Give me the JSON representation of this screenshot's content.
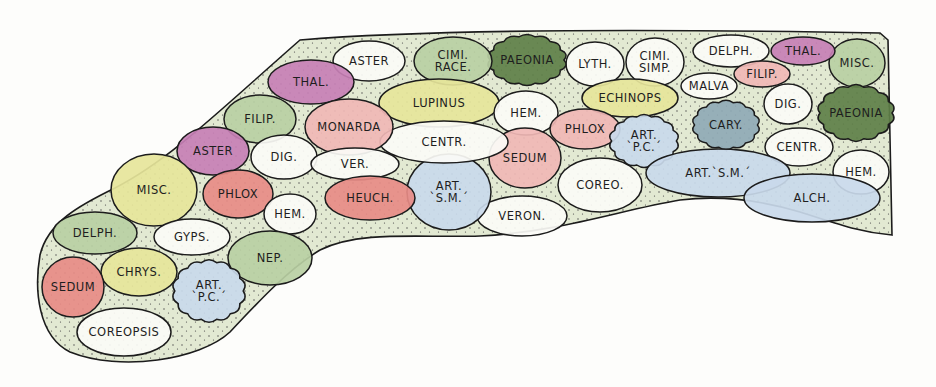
{
  "diagram": {
    "type": "garden-planting-plan",
    "colors": {
      "outline": "#1c1c1c",
      "bed_fill": "#d9e3c8",
      "green": "#b9cfa3",
      "dark_green": "#5e7f48",
      "yellow": "#e6e59a",
      "pink": "#f0b7b5",
      "red": "#e78b86",
      "purple": "#c77fb5",
      "blue": "#c9d9ea",
      "blue_grey": "#8fa9b5",
      "white": "#fbfbf6"
    },
    "plants": [
      {
        "id": "misc-top-right",
        "label": "MISC.",
        "x": 857,
        "y": 63,
        "rx": 28,
        "ry": 24,
        "fill": "green",
        "shape": "ellipse"
      },
      {
        "id": "thal-1",
        "label": "THAL.",
        "x": 803,
        "y": 51,
        "rx": 32,
        "ry": 14,
        "fill": "purple",
        "shape": "ellipse"
      },
      {
        "id": "delph-1",
        "label": "DELPH.",
        "x": 731,
        "y": 51,
        "rx": 38,
        "ry": 16,
        "fill": "white",
        "shape": "ellipse"
      },
      {
        "id": "filip-1",
        "label": "FILIP.",
        "x": 762,
        "y": 74,
        "rx": 28,
        "ry": 13,
        "fill": "pink",
        "shape": "ellipse"
      },
      {
        "id": "malva",
        "label": "MALVA",
        "x": 709,
        "y": 86,
        "rx": 28,
        "ry": 13,
        "fill": "white",
        "shape": "ellipse"
      },
      {
        "id": "cimi-simp",
        "label": "CIMI.\nSIMP.",
        "x": 655,
        "y": 62,
        "rx": 29,
        "ry": 24,
        "fill": "white",
        "shape": "ellipse"
      },
      {
        "id": "lyth",
        "label": "LYTH.",
        "x": 595,
        "y": 64,
        "rx": 29,
        "ry": 22,
        "fill": "white",
        "shape": "ellipse"
      },
      {
        "id": "paeonia-1",
        "label": "PAEONIA",
        "x": 527,
        "y": 60,
        "rx": 41,
        "ry": 27,
        "fill": "dark_green",
        "shape": "cloud"
      },
      {
        "id": "cimi-race",
        "label": "CIMI.\nRACE.",
        "x": 453,
        "y": 61,
        "rx": 39,
        "ry": 24,
        "fill": "green",
        "shape": "ellipse"
      },
      {
        "id": "aster-1",
        "label": "ASTER",
        "x": 369,
        "y": 61,
        "rx": 36,
        "ry": 20,
        "fill": "white",
        "shape": "ellipse"
      },
      {
        "id": "thal-2",
        "label": "THAL.",
        "x": 311,
        "y": 82,
        "rx": 43,
        "ry": 22,
        "fill": "purple",
        "shape": "ellipse"
      },
      {
        "id": "lupinus",
        "label": "LUPINUS",
        "x": 439,
        "y": 103,
        "rx": 60,
        "ry": 24,
        "fill": "yellow",
        "shape": "ellipse"
      },
      {
        "id": "hem-1",
        "label": "HEM.",
        "x": 526,
        "y": 113,
        "rx": 32,
        "ry": 22,
        "fill": "white",
        "shape": "ellipse"
      },
      {
        "id": "echinops",
        "label": "ECHINOPS",
        "x": 630,
        "y": 98,
        "rx": 48,
        "ry": 19,
        "fill": "yellow",
        "shape": "ellipse"
      },
      {
        "id": "phlox-1",
        "label": "PHLOX",
        "x": 585,
        "y": 129,
        "rx": 35,
        "ry": 20,
        "fill": "pink",
        "shape": "ellipse"
      },
      {
        "id": "art-pc-1",
        "label": "ART.\n`P.C.´",
        "x": 644,
        "y": 141,
        "rx": 36,
        "ry": 28,
        "fill": "blue",
        "shape": "cloud"
      },
      {
        "id": "cary",
        "label": "CARY.",
        "x": 726,
        "y": 125,
        "rx": 35,
        "ry": 26,
        "fill": "blue_grey",
        "shape": "cloud"
      },
      {
        "id": "dig-1",
        "label": "DIG.",
        "x": 788,
        "y": 104,
        "rx": 24,
        "ry": 20,
        "fill": "white",
        "shape": "ellipse"
      },
      {
        "id": "paeonia-2",
        "label": "PAEONIA",
        "x": 856,
        "y": 113,
        "rx": 40,
        "ry": 30,
        "fill": "dark_green",
        "shape": "cloud"
      },
      {
        "id": "centr-1",
        "label": "CENTR.",
        "x": 799,
        "y": 147,
        "rx": 34,
        "ry": 19,
        "fill": "white",
        "shape": "ellipse"
      },
      {
        "id": "hem-2",
        "label": "HEM.",
        "x": 861,
        "y": 172,
        "rx": 28,
        "ry": 22,
        "fill": "white",
        "shape": "ellipse"
      },
      {
        "id": "art-sm-1",
        "label": "ART.`S.M.´",
        "x": 718,
        "y": 173,
        "rx": 72,
        "ry": 24,
        "fill": "blue",
        "shape": "ellipse"
      },
      {
        "id": "alch",
        "label": "ALCH.",
        "x": 812,
        "y": 198,
        "rx": 68,
        "ry": 24,
        "fill": "blue",
        "shape": "ellipse"
      },
      {
        "id": "coreo",
        "label": "COREO.",
        "x": 600,
        "y": 185,
        "rx": 42,
        "ry": 27,
        "fill": "white",
        "shape": "ellipse"
      },
      {
        "id": "sedum-1",
        "label": "SEDUM",
        "x": 525,
        "y": 158,
        "rx": 36,
        "ry": 30,
        "fill": "pink",
        "shape": "ellipse"
      },
      {
        "id": "veron",
        "label": "VERON.",
        "x": 522,
        "y": 216,
        "rx": 45,
        "ry": 20,
        "fill": "white",
        "shape": "ellipse"
      },
      {
        "id": "art-sm-2",
        "label": "ART.\n`S.M.´",
        "x": 449,
        "y": 192,
        "rx": 42,
        "ry": 38,
        "fill": "blue",
        "shape": "ellipse"
      },
      {
        "id": "centr-2",
        "label": "CENTR.",
        "x": 444,
        "y": 142,
        "rx": 64,
        "ry": 21,
        "fill": "white",
        "shape": "ellipse"
      },
      {
        "id": "monarda",
        "label": "MONARDA",
        "x": 349,
        "y": 127,
        "rx": 44,
        "ry": 28,
        "fill": "pink",
        "shape": "ellipse"
      },
      {
        "id": "filip-2",
        "label": "FILIP.",
        "x": 260,
        "y": 119,
        "rx": 36,
        "ry": 24,
        "fill": "green",
        "shape": "ellipse"
      },
      {
        "id": "aster-2",
        "label": "ASTER",
        "x": 213,
        "y": 151,
        "rx": 36,
        "ry": 24,
        "fill": "purple",
        "shape": "ellipse"
      },
      {
        "id": "dig-2",
        "label": "DIG.",
        "x": 284,
        "y": 157,
        "rx": 33,
        "ry": 22,
        "fill": "white",
        "shape": "ellipse"
      },
      {
        "id": "ver",
        "label": "VER.",
        "x": 355,
        "y": 164,
        "rx": 44,
        "ry": 16,
        "fill": "white",
        "shape": "ellipse"
      },
      {
        "id": "heuch",
        "label": "HEUCH.",
        "x": 370,
        "y": 198,
        "rx": 45,
        "ry": 22,
        "fill": "red",
        "shape": "ellipse"
      },
      {
        "id": "misc-left",
        "label": "MISC.",
        "x": 154,
        "y": 190,
        "rx": 43,
        "ry": 36,
        "fill": "yellow",
        "shape": "ellipse"
      },
      {
        "id": "phlox-2",
        "label": "PHLOX",
        "x": 238,
        "y": 194,
        "rx": 35,
        "ry": 24,
        "fill": "red",
        "shape": "ellipse"
      },
      {
        "id": "hem-3",
        "label": "HEM.",
        "x": 290,
        "y": 214,
        "rx": 26,
        "ry": 20,
        "fill": "white",
        "shape": "ellipse"
      },
      {
        "id": "delph-2",
        "label": "DELPH.",
        "x": 95,
        "y": 233,
        "rx": 42,
        "ry": 21,
        "fill": "green",
        "shape": "ellipse"
      },
      {
        "id": "gyps",
        "label": "GYPS.",
        "x": 192,
        "y": 237,
        "rx": 38,
        "ry": 18,
        "fill": "white",
        "shape": "ellipse"
      },
      {
        "id": "nep",
        "label": "NEP.",
        "x": 270,
        "y": 258,
        "rx": 42,
        "ry": 27,
        "fill": "green",
        "shape": "ellipse"
      },
      {
        "id": "chrys",
        "label": "CHRYS.",
        "x": 139,
        "y": 272,
        "rx": 38,
        "ry": 24,
        "fill": "yellow",
        "shape": "ellipse"
      },
      {
        "id": "sedum-2",
        "label": "SEDUM",
        "x": 73,
        "y": 287,
        "rx": 31,
        "ry": 30,
        "fill": "red",
        "shape": "ellipse"
      },
      {
        "id": "art-pc-2",
        "label": "ART.\n`P.C.´",
        "x": 209,
        "y": 291,
        "rx": 38,
        "ry": 33,
        "fill": "blue",
        "shape": "cloud"
      },
      {
        "id": "coreopsis",
        "label": "COREOPSIS",
        "x": 124,
        "y": 332,
        "rx": 47,
        "ry": 24,
        "fill": "white",
        "shape": "ellipse"
      }
    ]
  }
}
